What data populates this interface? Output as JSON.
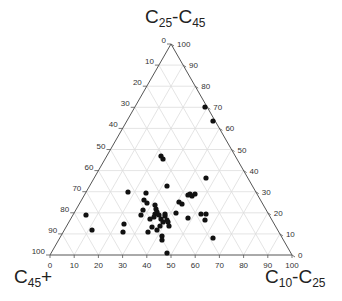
{
  "chart_data": {
    "type": "scatter",
    "subtype": "ternary",
    "title": "",
    "axes": {
      "top": {
        "label": "C25-C45",
        "label_main": "C",
        "sub1": "25",
        "sep": "-C",
        "sub2": "45",
        "ticks": [
          0,
          10,
          20,
          30,
          40,
          50,
          60,
          70,
          80,
          90,
          100
        ]
      },
      "left": {
        "label": "C45+",
        "label_main": "C",
        "sub1": "45",
        "suffix": "+",
        "ticks": [
          0,
          10,
          20,
          30,
          40,
          50,
          60,
          70,
          80,
          90,
          100
        ]
      },
      "right": {
        "label": "C10-C25",
        "label_main": "C",
        "sub1": "10",
        "sep": "-C",
        "sub2": "25",
        "ticks": [
          0,
          10,
          20,
          30,
          40,
          50,
          60,
          70,
          80,
          90,
          100
        ]
      }
    },
    "grid": true,
    "grid_step": 10,
    "point_color": "#111111",
    "grid_color": "#dddddd",
    "axis_color": "#555555",
    "points_pixel": [
      [
        205,
        107
      ],
      [
        213,
        121
      ],
      [
        161,
        156
      ],
      [
        163,
        159
      ],
      [
        206,
        178
      ],
      [
        128,
        192
      ],
      [
        146,
        193
      ],
      [
        167,
        186
      ],
      [
        144,
        200
      ],
      [
        147,
        203
      ],
      [
        143,
        210
      ],
      [
        141,
        215
      ],
      [
        155,
        214
      ],
      [
        154,
        217
      ],
      [
        150,
        219
      ],
      [
        155,
        205
      ],
      [
        156,
        209
      ],
      [
        157,
        212
      ],
      [
        159,
        215
      ],
      [
        161,
        219
      ],
      [
        165,
        216
      ],
      [
        165,
        214
      ],
      [
        167,
        220
      ],
      [
        168,
        222
      ],
      [
        169,
        226
      ],
      [
        163,
        222
      ],
      [
        160,
        226
      ],
      [
        157,
        230
      ],
      [
        152,
        227
      ],
      [
        148,
        232
      ],
      [
        162,
        236
      ],
      [
        176,
        213
      ],
      [
        179,
        202
      ],
      [
        188,
        195
      ],
      [
        190,
        194
      ],
      [
        192,
        196
      ],
      [
        195,
        194
      ],
      [
        188,
        218
      ],
      [
        201,
        214
      ],
      [
        206,
        214
      ],
      [
        205,
        220
      ],
      [
        213,
        238
      ],
      [
        162,
        240
      ],
      [
        167,
        253
      ],
      [
        86,
        215
      ],
      [
        92,
        230
      ],
      [
        124,
        224
      ],
      [
        123,
        232
      ],
      [
        182,
        204
      ]
    ],
    "points_ternary_note": "values as [C10-C25, C25-C45, C45+] percentages, estimated",
    "points": [
      [
        33,
        70,
        0
      ],
      [
        31,
        64,
        5
      ],
      [
        15,
        47,
        38
      ],
      [
        15,
        46,
        39
      ],
      [
        22,
        37,
        41
      ],
      [
        6,
        30,
        64
      ],
      [
        13,
        30,
        57
      ],
      [
        23,
        33,
        44
      ],
      [
        11,
        26,
        63
      ],
      [
        12,
        25,
        63
      ],
      [
        10,
        22,
        68
      ],
      [
        8,
        19,
        73
      ],
      [
        14,
        19,
        67
      ],
      [
        14,
        18,
        68
      ],
      [
        11,
        17,
        72
      ],
      [
        16,
        24,
        60
      ],
      [
        15,
        22,
        63
      ],
      [
        16,
        20,
        64
      ],
      [
        17,
        19,
        64
      ],
      [
        17,
        17,
        66
      ],
      [
        19,
        19,
        62
      ],
      [
        19,
        20,
        61
      ],
      [
        19,
        17,
        64
      ],
      [
        19,
        16,
        65
      ],
      [
        19,
        14,
        67
      ],
      [
        17,
        16,
        67
      ],
      [
        15,
        14,
        71
      ],
      [
        13,
        12,
        75
      ],
      [
        12,
        13,
        75
      ],
      [
        9,
        11,
        80
      ],
      [
        14,
        9,
        77
      ],
      [
        23,
        20,
        57
      ],
      [
        27,
        25,
        48
      ],
      [
        31,
        28,
        41
      ],
      [
        32,
        29,
        39
      ],
      [
        32,
        28,
        40
      ],
      [
        34,
        29,
        37
      ],
      [
        25,
        18,
        57
      ],
      [
        33,
        20,
        47
      ],
      [
        36,
        20,
        44
      ],
      [
        35,
        17,
        48
      ],
      [
        35,
        8,
        57
      ],
      [
        12,
        7,
        81
      ],
      [
        12,
        1,
        87
      ],
      [
        0,
        19,
        81
      ],
      [
        0,
        12,
        88
      ],
      [
        8,
        15,
        77
      ],
      [
        5,
        11,
        84
      ],
      [
        28,
        24,
        48
      ]
    ]
  }
}
